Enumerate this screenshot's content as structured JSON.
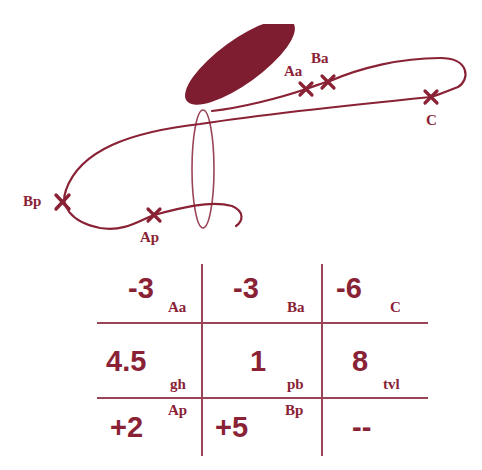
{
  "colors": {
    "primary": "#8a2236",
    "fill": "#7e1c30",
    "grid_line": "#9a4458"
  },
  "diagram": {
    "markers": [
      {
        "id": "Aa",
        "label": "Aa"
      },
      {
        "id": "Ba",
        "label": "Ba"
      },
      {
        "id": "C",
        "label": "C"
      },
      {
        "id": "Bp",
        "label": "Bp"
      },
      {
        "id": "Ap",
        "label": "Ap"
      }
    ]
  },
  "table": {
    "rows": [
      [
        {
          "value": "-3",
          "label": "Aa"
        },
        {
          "value": "-3",
          "label": "Ba"
        },
        {
          "value": "-6",
          "label": "C"
        }
      ],
      [
        {
          "value": "4.5",
          "label": "gh"
        },
        {
          "value": "1",
          "label": "pb"
        },
        {
          "value": "8",
          "label": "tvl"
        }
      ],
      [
        {
          "value": "+2",
          "label": "Ap"
        },
        {
          "value": "+5",
          "label": "Bp"
        },
        {
          "value": "--",
          "label": ""
        }
      ]
    ]
  }
}
